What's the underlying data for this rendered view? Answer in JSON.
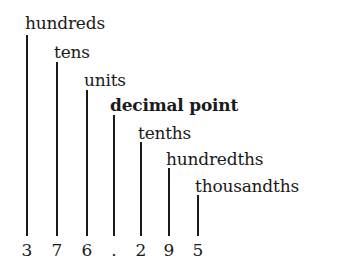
{
  "labels": [
    {
      "text": "hundreds",
      "bold": false
    },
    {
      "text": "tens",
      "bold": false
    },
    {
      "text": "units",
      "bold": false
    },
    {
      "text": "decimal point",
      "bold": true
    },
    {
      "text": "tenths",
      "bold": false
    },
    {
      "text": "hundredths",
      "bold": false
    },
    {
      "text": "thousandths",
      "bold": false
    }
  ],
  "digits": [
    "3",
    "7",
    "6",
    ".",
    "2",
    "9",
    "5"
  ],
  "number": "376.295"
}
